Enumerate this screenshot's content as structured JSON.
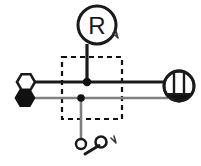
{
  "diagram": {
    "background_color": "#ffffff",
    "stroke_black": "#1a1a1a",
    "stroke_gray": "#808080",
    "fill_white": "#ffffff",
    "fill_black": "#111111",
    "dashed_color": "#111111"
  },
  "nodes": {
    "regulator": {
      "label": "R",
      "name": "regulator-symbol",
      "shape": "circle",
      "cx": 97,
      "cy": 25,
      "r": 19,
      "font_size": 24
    },
    "terminal_open": {
      "name": "open-hex-terminal",
      "shape": "hexagon",
      "fill": "white",
      "cx": 26,
      "cy": 82,
      "r": 9
    },
    "terminal_filled": {
      "name": "filled-hex-terminal",
      "shape": "hexagon",
      "fill": "black",
      "cx": 25,
      "cy": 98,
      "r": 9
    },
    "meter": {
      "name": "meter-indicator-symbol",
      "shape": "circle-segmented",
      "cx": 179,
      "cy": 86,
      "r": 16
    },
    "junction_top": {
      "name": "junction-dot-upper",
      "cx": 87,
      "cy": 82,
      "r": 4
    },
    "junction_bottom": {
      "name": "junction-dot-lower",
      "cx": 81,
      "cy": 98,
      "r": 3.5
    },
    "switch_pole": {
      "name": "switch-pole-circle",
      "cx": 81,
      "cy": 144,
      "r": 5
    },
    "switch_throw": {
      "name": "switch-throw-circle",
      "cx": 101,
      "cy": 142,
      "r": 5.5
    }
  },
  "wires": {
    "bus_black": {
      "name": "black-bus-wire",
      "x1": 33,
      "y1": 82,
      "x2": 167,
      "y2": 82,
      "width": 3.2,
      "color": "#1a1a1a"
    },
    "bus_gray": {
      "name": "gray-bus-wire",
      "x1": 32,
      "y1": 98,
      "x2": 168,
      "y2": 98,
      "width": 2.6,
      "color": "#808080"
    },
    "regulator_drop": {
      "name": "regulator-lead-wire",
      "x1": 87,
      "y1": 44,
      "x2": 87,
      "y2": 82,
      "width": 3.2,
      "color": "#1a1a1a"
    },
    "switch_drop": {
      "name": "switch-lead-wire",
      "x1": 81,
      "y1": 98,
      "x2": 81,
      "y2": 139,
      "width": 2.6,
      "color": "#808080"
    },
    "switch_lever": {
      "name": "switch-lever-wire",
      "x1": 86,
      "y1": 153,
      "x2": 99,
      "y2": 145,
      "width": 3.0,
      "color": "#1a1a1a"
    }
  },
  "dashed_box": {
    "name": "grouping-dashed-box",
    "x": 62,
    "y": 57,
    "width": 60,
    "height": 62,
    "dash": "5 4",
    "width_px": 2.2
  },
  "annotations": [
    {
      "name": "callout-tick-regulator",
      "glyph": "tick",
      "x": 114,
      "y": 36
    },
    {
      "name": "callout-tick-switch",
      "glyph": "tick",
      "x": 113,
      "y": 140
    }
  ]
}
